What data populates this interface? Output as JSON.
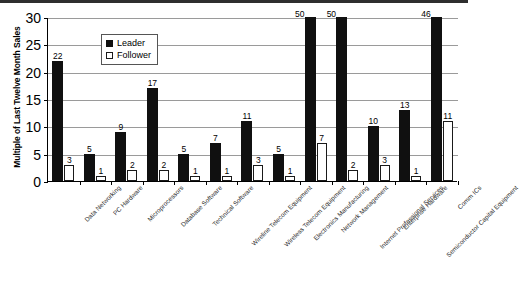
{
  "chart_data": {
    "type": "bar",
    "title": "",
    "xlabel": "",
    "ylabel": "Multiple of Last Twelve Month Sales",
    "ylim": [
      0,
      30
    ],
    "yticks": [
      0,
      5,
      10,
      15,
      20,
      25,
      30
    ],
    "grid": true,
    "legend_position": "top-left-inside",
    "categories": [
      "Data Networking",
      "PC Hardware",
      "Microprocessors",
      "Database Software",
      "Technical Software",
      "Wireline Telecom Equipment",
      "Wireless Telecom Equipment",
      "Electronics Manufacturing",
      "Network Management",
      "Internet Professional Services",
      "Enterprise Hardware",
      "Semiconductor Capital Equipment",
      "Comm ICs"
    ],
    "series": [
      {
        "name": "Leader",
        "color": "#101010",
        "values": [
          22,
          5,
          9,
          17,
          5,
          7,
          11,
          5,
          50,
          50,
          10,
          13,
          46
        ]
      },
      {
        "name": "Follower",
        "color": "#ffffff",
        "values": [
          3,
          1,
          2,
          2,
          1,
          1,
          3,
          1,
          7,
          2,
          3,
          1,
          11
        ]
      }
    ]
  },
  "legend": {
    "items": [
      {
        "label": "Leader"
      },
      {
        "label": "Follower"
      }
    ]
  },
  "axis": {
    "y_title": "Multiple of Last Twelve Month Sales",
    "y_tick_labels": [
      "30",
      "25",
      "20",
      "15",
      "10",
      "5",
      "0"
    ]
  }
}
